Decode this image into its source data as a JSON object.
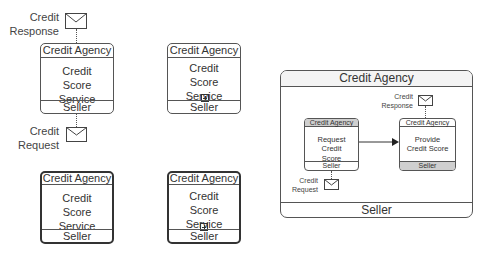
{
  "diagram": {
    "type": "BPMN choreography notation",
    "colors": {
      "border": "#555555",
      "thick_border": "#333333",
      "shaded_band": "#cfcfcf",
      "text": "#333333"
    },
    "task_top_left": {
      "initiator": "Credit Agency",
      "name": "Credit Score Service",
      "participant": "Seller",
      "message_top": {
        "label_line1": "Credit",
        "label_line2": "Response"
      },
      "message_bottom": {
        "label_line1": "Credit",
        "label_line2": "Request"
      }
    },
    "subchoreo_top_right": {
      "initiator": "Credit Agency",
      "name": "Credit Score Service",
      "participant": "Seller",
      "marker": "collapsed-plus"
    },
    "call_task_bottom_left": {
      "initiator": "Credit Agency",
      "name": "Credit Score Service",
      "participant": "Seller"
    },
    "call_subchoreo_bottom_right": {
      "initiator": "Credit Agency",
      "name": "Credit Score Service",
      "participant": "Seller",
      "marker": "collapsed-plus"
    },
    "expanded_subchoreo": {
      "initiator": "Credit Agency",
      "participant": "Seller",
      "inner_task_left": {
        "initiator": "Credit Agency",
        "name": "Request Credit Score",
        "participant": "Seller",
        "message": {
          "label_line1": "Credit",
          "label_line2": "Request"
        }
      },
      "inner_task_right": {
        "initiator": "Credit Agency",
        "name": "Provide Credit Score",
        "participant": "Seller",
        "message": {
          "label_line1": "Credit",
          "label_line2": "Response"
        }
      }
    }
  }
}
